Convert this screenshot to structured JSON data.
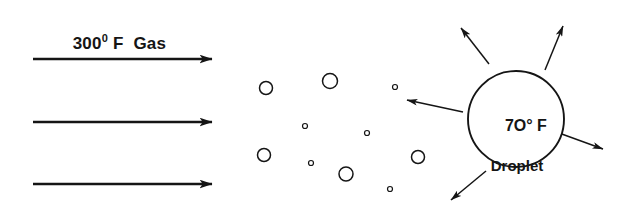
{
  "figure": {
    "background_color": "#ffffff",
    "ink_color": "#151515",
    "width": 633,
    "height": 211
  },
  "labels": {
    "gas": {
      "value": "300",
      "superscript": "0",
      "unit": "F",
      "medium": "Gas",
      "full_text": "300⁰ F  Gas"
    },
    "droplet": {
      "temperature": "7O° F",
      "name": "Droplet"
    }
  },
  "chart_data": {
    "type": "diagram",
    "flow_arrows": [
      {
        "name": "gas-flow-arrow-top",
        "x1": 33,
        "y1": 59,
        "x2": 212,
        "y2": 59
      },
      {
        "name": "gas-flow-arrow-middle",
        "x1": 33,
        "y1": 122,
        "x2": 212,
        "y2": 122
      },
      {
        "name": "gas-flow-arrow-bottom",
        "x1": 33,
        "y1": 184,
        "x2": 212,
        "y2": 184
      }
    ],
    "radiation_arrows": [
      {
        "name": "radiation-arrow-upper-left",
        "x1": 489,
        "y1": 64,
        "x2": 461,
        "y2": 28
      },
      {
        "name": "radiation-arrow-upper-right",
        "x1": 545,
        "y1": 70,
        "x2": 563,
        "y2": 26
      },
      {
        "name": "radiation-arrow-left",
        "x1": 463,
        "y1": 112,
        "x2": 407,
        "y2": 100
      },
      {
        "name": "radiation-arrow-lower-right",
        "x1": 559,
        "y1": 133,
        "x2": 603,
        "y2": 149
      },
      {
        "name": "radiation-arrow-lower-left",
        "x1": 486,
        "y1": 171,
        "x2": 451,
        "y2": 200
      }
    ],
    "droplet": {
      "cx": 516,
      "cy": 119,
      "r": 48
    },
    "spray_droplets": [
      {
        "cx": 266,
        "cy": 88,
        "r": 6.5
      },
      {
        "cx": 330,
        "cy": 81,
        "r": 7.5
      },
      {
        "cx": 395,
        "cy": 87,
        "r": 2.5
      },
      {
        "cx": 305,
        "cy": 126,
        "r": 2.5
      },
      {
        "cx": 367,
        "cy": 133,
        "r": 2.5
      },
      {
        "cx": 264,
        "cy": 155,
        "r": 6.5
      },
      {
        "cx": 311,
        "cy": 163,
        "r": 2.5
      },
      {
        "cx": 346,
        "cy": 174,
        "r": 7
      },
      {
        "cx": 418,
        "cy": 157,
        "r": 6.5
      },
      {
        "cx": 390,
        "cy": 189,
        "r": 2.5
      }
    ]
  }
}
